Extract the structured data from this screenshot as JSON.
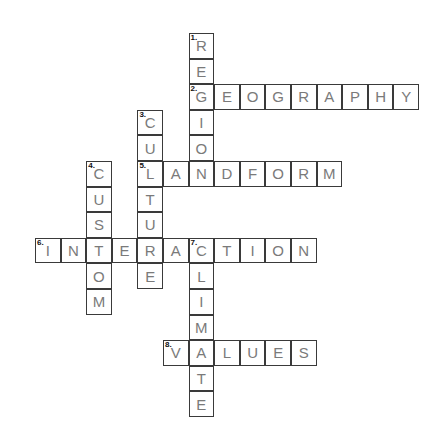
{
  "puzzle": {
    "type": "crossword",
    "words": [
      {
        "number": "1",
        "answer": "REGION",
        "direction": "down",
        "row": 0,
        "col": 6
      },
      {
        "number": "2",
        "answer": "GEOGRAPHY",
        "direction": "across",
        "row": 2,
        "col": 6
      },
      {
        "number": "3",
        "answer": "CULTURE",
        "direction": "down",
        "row": 3,
        "col": 4
      },
      {
        "number": "4",
        "answer": "CUSTOM",
        "direction": "down",
        "row": 5,
        "col": 2
      },
      {
        "number": "5",
        "answer": "LANDFORM",
        "direction": "across",
        "row": 5,
        "col": 4
      },
      {
        "number": "6",
        "answer": "INTERACTION",
        "direction": "across",
        "row": 8,
        "col": 0
      },
      {
        "number": "7",
        "answer": "CLIMATE",
        "direction": "down",
        "row": 8,
        "col": 6
      },
      {
        "number": "8",
        "answer": "VALUES",
        "direction": "across",
        "row": 12,
        "col": 5
      }
    ]
  }
}
